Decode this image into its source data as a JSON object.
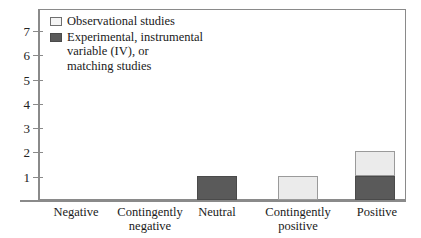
{
  "chart_data": {
    "type": "bar",
    "stacked": true,
    "title": "",
    "subtitle": "",
    "xlabel": "",
    "ylabel": "",
    "categories": [
      "Negative",
      "Contingently negative",
      "Neutral",
      "Contingently positive",
      "Positive"
    ],
    "series": [
      {
        "name": "Experimental, instrumental variable (IV), or matching studies",
        "values": [
          0,
          0,
          1,
          0,
          1
        ],
        "color": "#5a5a5a"
      },
      {
        "name": "Observational studies",
        "values": [
          0,
          0,
          0,
          1,
          1
        ],
        "color": "#ebebeb"
      }
    ],
    "totals": [
      0,
      0,
      1,
      1,
      2
    ],
    "ylim": [
      0,
      7.5
    ],
    "yticks": [
      1,
      2,
      3,
      4,
      5,
      6,
      7
    ],
    "ytick_labels": [
      "1",
      "2",
      "3",
      "4",
      "5",
      "6",
      "7"
    ],
    "grid": false,
    "legend_position": "top-left"
  },
  "legend": {
    "items": [
      {
        "label": "Observational studies",
        "swatch": "light-square-icon"
      },
      {
        "label": "Experimental, instrumental\nvariable (IV), or\nmatching studies",
        "swatch": "dark-square-icon"
      }
    ]
  },
  "axes": {
    "y_tick_labels": [
      "7",
      "6",
      "5",
      "4",
      "3",
      "2",
      "1"
    ],
    "x_category_labels": [
      "Negative",
      "Contingently\nnegative",
      "Neutral",
      "Contingently\npositive",
      "Positive"
    ]
  },
  "colors": {
    "dark_fill": "#5a5a5a",
    "light_fill": "#ebebeb",
    "axis": "#8a8a8a",
    "text": "#1a1a1a",
    "background": "#ffffff"
  }
}
